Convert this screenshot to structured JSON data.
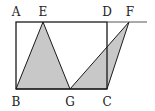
{
  "diagram": {
    "type": "geometry",
    "colors": {
      "stroke": "#1a1a1a",
      "fill": "#c8c8c8",
      "background": "#ffffff"
    },
    "points": {
      "A": {
        "label": "A",
        "x": 16,
        "y": 22
      },
      "E": {
        "label": "E",
        "x": 43,
        "y": 22
      },
      "D": {
        "label": "D",
        "x": 107,
        "y": 22
      },
      "F": {
        "label": "F",
        "x": 129,
        "y": 22
      },
      "B": {
        "label": "B",
        "x": 16,
        "y": 89
      },
      "G": {
        "label": "G",
        "x": 70,
        "y": 89
      },
      "C": {
        "label": "C",
        "x": 107,
        "y": 89
      }
    },
    "shapes": [
      {
        "name": "rectangle",
        "vertices": [
          "A",
          "B",
          "C",
          "D"
        ],
        "shaded": false
      },
      {
        "name": "triangle-EBG",
        "vertices": [
          "E",
          "B",
          "G"
        ],
        "shaded": true
      },
      {
        "name": "triangle-GCF",
        "vertices": [
          "G",
          "C",
          "F"
        ],
        "shaded": true
      }
    ],
    "extended_line": {
      "from": "A",
      "to_x": 147,
      "y": 22
    }
  }
}
